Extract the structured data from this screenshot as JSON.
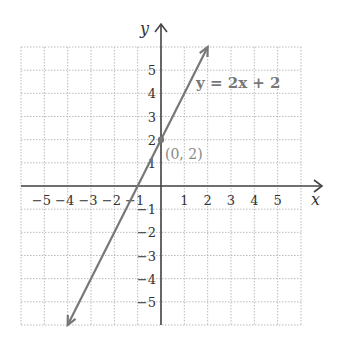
{
  "chart_data": {
    "type": "line",
    "title": "",
    "xlabel": "x",
    "ylabel": "y",
    "xlim": [
      -6,
      6
    ],
    "ylim": [
      -6,
      6
    ],
    "grid": true,
    "x_ticks": [
      -5,
      -4,
      -3,
      -2,
      -1,
      1,
      2,
      3,
      4,
      5
    ],
    "y_ticks": [
      -5,
      -4,
      -3,
      -2,
      -1,
      1,
      2,
      3,
      4,
      5
    ],
    "series": [
      {
        "name": "y = 2x + 2",
        "equation": "y = 2x + 2",
        "slope": 2,
        "intercept": 2,
        "x": [
          -4,
          2
        ],
        "y": [
          -6,
          6
        ],
        "arrows_both_ends": true,
        "color": "#777777"
      }
    ],
    "annotations": [
      {
        "label": "(0, 2)",
        "x": 0,
        "y": 2,
        "type": "point"
      },
      {
        "label": "y = 2x + 2",
        "type": "line-label"
      }
    ]
  },
  "labels": {
    "x_axis": "x",
    "y_axis": "y",
    "equation": "y = 2x + 2",
    "point": "(0, 2)"
  }
}
